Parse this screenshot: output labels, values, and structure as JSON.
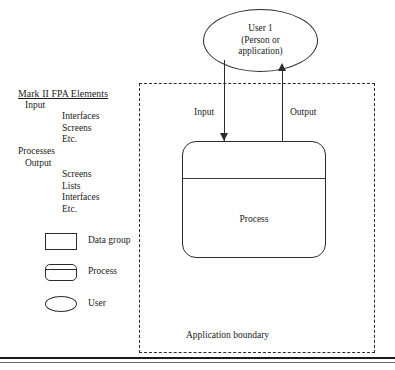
{
  "elements_panel": {
    "title": "Mark II FPA Elements",
    "rows": [
      {
        "text": "Input",
        "level": 1
      },
      {
        "text": "Interfaces",
        "level": 2
      },
      {
        "text": "Screens",
        "level": 2
      },
      {
        "text": "Etc.",
        "level": 2
      },
      {
        "text": "Processes",
        "level": 0
      },
      {
        "text": "Output",
        "level": 1
      },
      {
        "text": "Screens",
        "level": 2
      },
      {
        "text": "Lists",
        "level": 2
      },
      {
        "text": "Interfaces",
        "level": 2
      },
      {
        "text": "Etc.",
        "level": 2
      }
    ]
  },
  "legend": {
    "items": [
      {
        "symbol": "rectangle",
        "label": "Data group"
      },
      {
        "symbol": "rounded-rectangle-with-divider",
        "label": "Process"
      },
      {
        "symbol": "ellipse",
        "label": "User"
      }
    ]
  },
  "diagram": {
    "boundary_label": "Application boundary",
    "user": {
      "line1": "User 1",
      "line2": "(Person or",
      "line3": "application)"
    },
    "process_label": "Process",
    "flows": [
      {
        "label": "Input",
        "direction": "down"
      },
      {
        "label": "Output",
        "direction": "up"
      }
    ]
  },
  "colors": {
    "stroke": "#2b2b2b",
    "text": "#1a1a1a",
    "background": "#ffffff",
    "rule": "#1a1a1a"
  }
}
